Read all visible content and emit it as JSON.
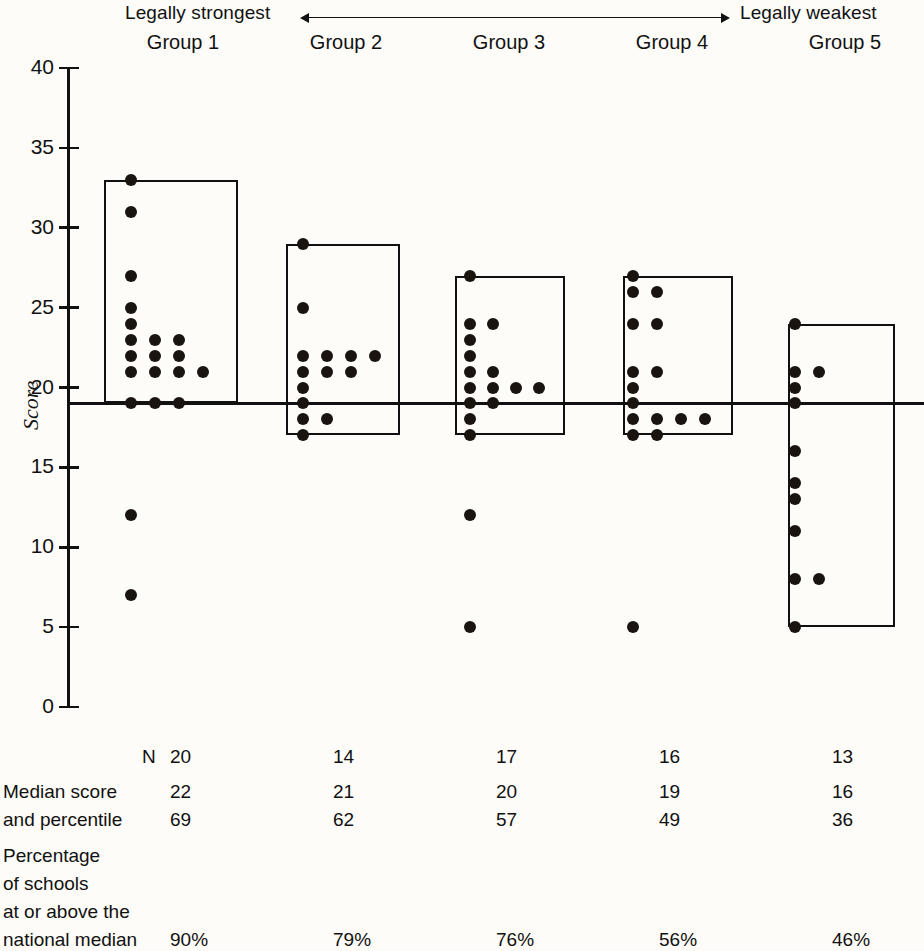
{
  "header": {
    "left_label": "Legally strongest",
    "right_label": "Legally weakest",
    "arrow_icon": "double-arrow-icon"
  },
  "axis": {
    "label": "Score",
    "ticks": [
      "40",
      "35",
      "30",
      "25",
      "20",
      "15",
      "10",
      "5",
      "0"
    ],
    "tick_values": [
      40,
      35,
      30,
      25,
      20,
      15,
      10,
      5,
      0
    ],
    "min": 0,
    "max": 40
  },
  "groups": [
    {
      "name": "Group 1",
      "n": "20",
      "median_score": "22",
      "percentile": "69",
      "pct_at_or_above": "90%"
    },
    {
      "name": "Group 2",
      "n": "14",
      "median_score": "21",
      "percentile": "62",
      "pct_at_or_above": "79%"
    },
    {
      "name": "Group 3",
      "n": "17",
      "median_score": "20",
      "percentile": "57",
      "pct_at_or_above": "76%"
    },
    {
      "name": "Group 4",
      "n": "16",
      "median_score": "19",
      "percentile": "49",
      "pct_at_or_above": "56%"
    },
    {
      "name": "Group 5",
      "n": "13",
      "median_score": "16",
      "percentile": "36",
      "pct_at_or_above": "46%"
    }
  ],
  "table": {
    "row_n_label": "N",
    "row_median_label_line1": "Median score",
    "row_median_label_line2": "and percentile",
    "row_pct_label_line1": "Percentage",
    "row_pct_label_line2": "of schools",
    "row_pct_label_line3": "at or above the",
    "row_pct_label_line4": "national median"
  },
  "chart_data": {
    "type": "scatter",
    "title": "",
    "subtitle": "",
    "xlabel": "",
    "ylabel": "Score",
    "ylim": [
      0,
      40
    ],
    "grid": false,
    "legend": "none",
    "reference_line": {
      "value": 19,
      "label": "national median reference",
      "orientation": "horizontal"
    },
    "categories": [
      "Group 1",
      "Group 2",
      "Group 3",
      "Group 4",
      "Group 5"
    ],
    "axis_annotation": {
      "left": "Legally strongest",
      "right": "Legally weakest"
    },
    "series": [
      {
        "name": "Group 1",
        "n": 20,
        "box": {
          "top": 33,
          "bottom": 19
        },
        "points": [
          {
            "score": 33,
            "count": 1
          },
          {
            "score": 31,
            "count": 1
          },
          {
            "score": 27,
            "count": 1
          },
          {
            "score": 25,
            "count": 1
          },
          {
            "score": 24,
            "count": 1
          },
          {
            "score": 23,
            "count": 3
          },
          {
            "score": 22,
            "count": 3
          },
          {
            "score": 21,
            "count": 4
          },
          {
            "score": 19,
            "count": 3
          },
          {
            "score": 12,
            "count": 1
          },
          {
            "score": 7,
            "count": 1
          }
        ]
      },
      {
        "name": "Group 2",
        "n": 14,
        "box": {
          "top": 29,
          "bottom": 17
        },
        "points": [
          {
            "score": 29,
            "count": 1
          },
          {
            "score": 25,
            "count": 1
          },
          {
            "score": 22,
            "count": 4
          },
          {
            "score": 21,
            "count": 3
          },
          {
            "score": 20,
            "count": 1
          },
          {
            "score": 19,
            "count": 1
          },
          {
            "score": 18,
            "count": 2
          },
          {
            "score": 17,
            "count": 1
          }
        ]
      },
      {
        "name": "Group 3",
        "n": 17,
        "box": {
          "top": 27,
          "bottom": 17
        },
        "points": [
          {
            "score": 27,
            "count": 1
          },
          {
            "score": 24,
            "count": 2
          },
          {
            "score": 23,
            "count": 1
          },
          {
            "score": 22,
            "count": 1
          },
          {
            "score": 21,
            "count": 2
          },
          {
            "score": 20,
            "count": 4
          },
          {
            "score": 19,
            "count": 2
          },
          {
            "score": 18,
            "count": 1
          },
          {
            "score": 17,
            "count": 1
          },
          {
            "score": 12,
            "count": 1
          },
          {
            "score": 5,
            "count": 1
          }
        ]
      },
      {
        "name": "Group 4",
        "n": 16,
        "box": {
          "top": 27,
          "bottom": 17
        },
        "points": [
          {
            "score": 27,
            "count": 1
          },
          {
            "score": 26,
            "count": 2
          },
          {
            "score": 24,
            "count": 2
          },
          {
            "score": 21,
            "count": 2
          },
          {
            "score": 20,
            "count": 1
          },
          {
            "score": 19,
            "count": 1
          },
          {
            "score": 18,
            "count": 4
          },
          {
            "score": 17,
            "count": 2
          },
          {
            "score": 5,
            "count": 1
          }
        ]
      },
      {
        "name": "Group 5",
        "n": 13,
        "box": {
          "top": 24,
          "bottom": 5
        },
        "points": [
          {
            "score": 24,
            "count": 1
          },
          {
            "score": 21,
            "count": 2
          },
          {
            "score": 20,
            "count": 1
          },
          {
            "score": 19,
            "count": 1
          },
          {
            "score": 16,
            "count": 1
          },
          {
            "score": 14,
            "count": 1
          },
          {
            "score": 13,
            "count": 1
          },
          {
            "score": 11,
            "count": 1
          },
          {
            "score": 8,
            "count": 2
          },
          {
            "score": 5,
            "count": 1
          }
        ]
      }
    ],
    "summary_table": {
      "rows": [
        "N",
        "Median score",
        "and percentile",
        "national median"
      ],
      "N": [
        20,
        14,
        17,
        16,
        13
      ],
      "median_score": [
        22,
        21,
        20,
        19,
        16
      ],
      "percentile": [
        69,
        62,
        57,
        49,
        36
      ],
      "pct_at_or_above_national_median": [
        "90%",
        "79%",
        "76%",
        "56%",
        "46%"
      ]
    }
  }
}
